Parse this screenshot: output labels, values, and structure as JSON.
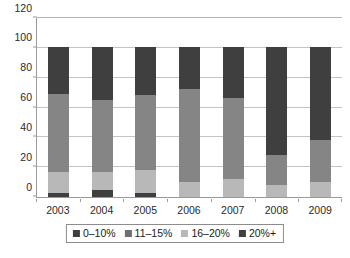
{
  "chart_data": {
    "type": "bar",
    "stacked": true,
    "title": "",
    "subtitle": "",
    "xlabel": "",
    "ylabel": "",
    "categories": [
      "2003",
      "2004",
      "2005",
      "2006",
      "2007",
      "2008",
      "2009"
    ],
    "ylim": [
      0,
      120
    ],
    "yticks": [
      0,
      20,
      40,
      60,
      80,
      100,
      120
    ],
    "ytick_labels": [
      "0",
      "20",
      "40",
      "60",
      "80",
      "100",
      "120"
    ],
    "grid": true,
    "grid_axis": "y",
    "legend_position": "bottom-center",
    "series": [
      {
        "name": "0–10%",
        "color": "#3f3f3f",
        "values": [
          3,
          5,
          3,
          0,
          0,
          0,
          0
        ]
      },
      {
        "name": "11–15%",
        "color": "#b8b8b8",
        "values": [
          14,
          12,
          15,
          10,
          12,
          8,
          10
        ]
      },
      {
        "name": "16–20%",
        "color": "#858585",
        "values": [
          52,
          48,
          50,
          62,
          54,
          20,
          28
        ]
      },
      {
        "name": "20%+",
        "color": "#3f3f3f",
        "values": [
          31,
          35,
          32,
          28,
          34,
          72,
          62
        ]
      }
    ],
    "totals": [
      100,
      100,
      100,
      100,
      100,
      100,
      100
    ]
  },
  "legend": {
    "items": [
      {
        "label": "0–10%",
        "color": "#3f3f3f"
      },
      {
        "label": "11–15%",
        "color": "#6f6f6f"
      },
      {
        "label": "16–20%",
        "color": "#b8b8b8"
      },
      {
        "label": "20%+",
        "color": "#3f3f3f"
      }
    ]
  },
  "axis_colors": {
    "axis_line": "#9a9a9a",
    "gridline": "#c4c4c4",
    "text": "#1a1a1a",
    "background": "#ffffff"
  }
}
